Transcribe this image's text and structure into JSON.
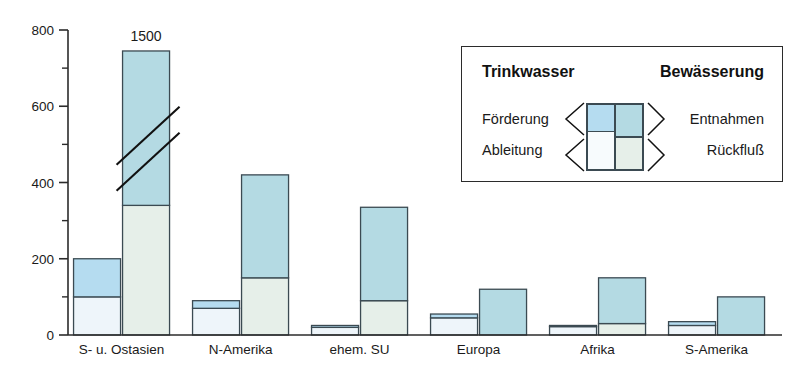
{
  "chart_data": {
    "type": "bar",
    "title": "",
    "subtitle": "",
    "xlabel": "",
    "ylabel": "",
    "ylim": [
      0,
      800
    ],
    "grid": false,
    "stacked": true,
    "categories": [
      "S- u. Ostasien",
      "N-Amerika",
      "ehem. SU",
      "Europa",
      "Afrika",
      "S-Amerika"
    ],
    "y_ticks_major": [
      0,
      200,
      400,
      600,
      800
    ],
    "y_ticks_minor": [
      100,
      300,
      500,
      700
    ],
    "legend_position": "inside-top-right",
    "annotations": [
      {
        "text": "1500",
        "category": "S- u. Ostasien",
        "series": "Bewässerung",
        "note": "bar truncated with axis break; true total is 1500"
      }
    ],
    "series": [
      {
        "name": "Trinkwasser",
        "segments": [
          {
            "name": "Ableitung",
            "color": "#eef5fa",
            "values": [
              100,
              70,
              20,
              45,
              22,
              25
            ]
          },
          {
            "name": "Förderung",
            "color": "#b5dcf0",
            "values": [
              100,
              20,
              5,
              10,
              3,
              10
            ]
          }
        ],
        "totals": [
          200,
          90,
          25,
          55,
          25,
          35
        ]
      },
      {
        "name": "Bewässerung",
        "segments": [
          {
            "name": "Rückfluß",
            "color": "#e6efe9",
            "values": [
              340,
              150,
              90,
              0,
              30,
              0
            ]
          },
          {
            "name": "Entnahmen",
            "color": "#b4dae3",
            "values": [
              405,
              270,
              245,
              120,
              120,
              100
            ]
          }
        ],
        "totals": [
          1500,
          420,
          335,
          120,
          150,
          100
        ],
        "truncated": [
          true,
          false,
          false,
          false,
          false,
          false
        ],
        "drawn_totals": [
          745,
          420,
          335,
          120,
          150,
          100
        ]
      }
    ]
  },
  "legend": {
    "title_left": "Trinkwasser",
    "title_right": "Bewässerung",
    "rows": [
      {
        "left": "Förderung",
        "right": "Entnahmen"
      },
      {
        "left": "Ableitung",
        "right": "Rückfluß"
      }
    ],
    "swatch": {
      "top_left_color": "#b5dcf0",
      "top_right_color": "#b4dae3",
      "bottom_left_color": "#f7fbfd",
      "bottom_right_color": "#e6efe9"
    }
  },
  "colors": {
    "axis": "#2b2b2b",
    "outline": "#3b4a52",
    "background": "#ffffff"
  }
}
